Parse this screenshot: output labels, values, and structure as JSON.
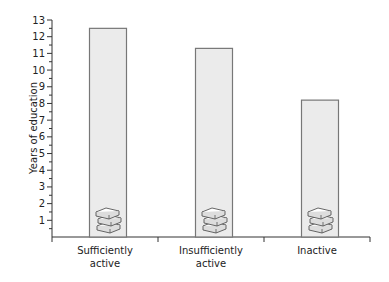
{
  "chart_data": {
    "type": "bar",
    "title": "",
    "xlabel": "",
    "ylabel": "Years of education",
    "categories": [
      [
        "Sufficiently",
        "active"
      ],
      [
        "Insufficiently",
        "active"
      ],
      [
        "Inactive"
      ]
    ],
    "values": [
      12.5,
      11.3,
      8.2
    ],
    "ylim": [
      0,
      13
    ],
    "yticks": [
      1,
      2,
      3,
      4,
      5,
      6,
      7,
      8,
      9,
      10,
      11,
      12,
      13
    ],
    "minor_tick_step": 0.5,
    "grid": false,
    "legend": null,
    "bar_icon": "books-stack-icon",
    "colors": {
      "bar_fill": "#ebebeb",
      "bar_stroke": "#777777",
      "axis": "#333333"
    }
  }
}
